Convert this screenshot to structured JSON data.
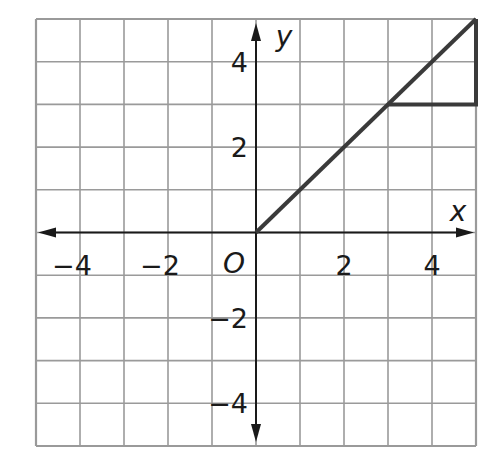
{
  "chart_data": {
    "type": "line",
    "title": "",
    "xlabel": "x",
    "ylabel": "y",
    "origin_label": "O",
    "xlim": [
      -5,
      5
    ],
    "ylim": [
      -5,
      5
    ],
    "grid": true,
    "grid_step": 1,
    "x_ticks": [
      -4,
      -2,
      2,
      4
    ],
    "y_ticks": [
      4,
      2,
      -2,
      -4
    ],
    "x_tick_labels": [
      "−4",
      "−2",
      "2",
      "4"
    ],
    "y_tick_labels": [
      "4",
      "2",
      "−2",
      "−4"
    ],
    "series": [
      {
        "name": "line",
        "x": [
          0,
          5
        ],
        "y": [
          0,
          5
        ]
      },
      {
        "name": "slope-triangle",
        "x": [
          3,
          5,
          5
        ],
        "y": [
          3,
          3,
          5
        ]
      }
    ],
    "colors": {
      "grid": "#9a9a9a",
      "axis": "#1a1a1a",
      "line": "#3a3a3a"
    }
  }
}
